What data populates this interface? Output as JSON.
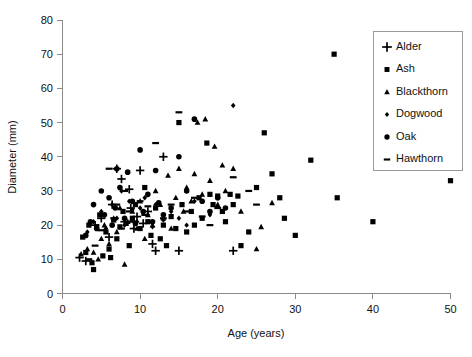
{
  "chart_data": {
    "type": "scatter",
    "title": "",
    "xlabel": "Age (years)",
    "ylabel": "Diameter (mm)",
    "xlim": [
      0,
      50
    ],
    "ylim": [
      0,
      80
    ],
    "xticks": [
      0,
      10,
      20,
      30,
      40,
      50
    ],
    "yticks": [
      0,
      10,
      20,
      30,
      40,
      50,
      60,
      70,
      80
    ],
    "grid": false,
    "legend_position": "top-right",
    "series": [
      {
        "name": "Alder",
        "marker": "plus",
        "points": [
          [
            2.2,
            10.5
          ],
          [
            3.0,
            9.5
          ],
          [
            4.2,
            20.0
          ],
          [
            5.0,
            22.0
          ],
          [
            6.0,
            16.5
          ],
          [
            6.4,
            26.0
          ],
          [
            7.0,
            36.5
          ],
          [
            7.6,
            33.5
          ],
          [
            8.0,
            21.0
          ],
          [
            8.6,
            30.5
          ],
          [
            8.8,
            25.0
          ],
          [
            9.2,
            19.0
          ],
          [
            9.6,
            22.5
          ],
          [
            10.0,
            36.0
          ],
          [
            10.4,
            20.5
          ],
          [
            11.0,
            24.0
          ],
          [
            11.6,
            14.5
          ],
          [
            12.0,
            12.5
          ],
          [
            13.0,
            40.0
          ],
          [
            15.0,
            12.5
          ],
          [
            22.0,
            12.5
          ]
        ]
      },
      {
        "name": "Ash",
        "marker": "square",
        "points": [
          [
            2.6,
            16.5
          ],
          [
            3.0,
            12.0
          ],
          [
            3.4,
            20.0
          ],
          [
            3.8,
            9.0
          ],
          [
            4.0,
            7.0
          ],
          [
            4.4,
            19.5
          ],
          [
            4.8,
            23.0
          ],
          [
            5.2,
            11.0
          ],
          [
            5.6,
            18.0
          ],
          [
            6.0,
            13.0
          ],
          [
            6.2,
            10.5
          ],
          [
            6.6,
            21.5
          ],
          [
            7.0,
            16.0
          ],
          [
            7.4,
            19.5
          ],
          [
            7.8,
            24.0
          ],
          [
            8.2,
            20.5
          ],
          [
            8.6,
            14.0
          ],
          [
            9.0,
            22.0
          ],
          [
            9.4,
            26.0
          ],
          [
            10.0,
            19.0
          ],
          [
            10.6,
            31.0
          ],
          [
            11.0,
            21.0
          ],
          [
            11.4,
            17.0
          ],
          [
            12.0,
            25.0
          ],
          [
            12.6,
            16.0
          ],
          [
            13.0,
            20.0
          ],
          [
            13.4,
            14.0
          ],
          [
            14.0,
            22.5
          ],
          [
            14.6,
            19.0
          ],
          [
            15.0,
            50.0
          ],
          [
            15.4,
            26.0
          ],
          [
            16.0,
            18.0
          ],
          [
            16.6,
            24.0
          ],
          [
            17.0,
            20.0
          ],
          [
            17.6,
            28.0
          ],
          [
            18.0,
            22.0
          ],
          [
            18.6,
            44.0
          ],
          [
            19.0,
            29.0
          ],
          [
            19.4,
            26.0
          ],
          [
            20.0,
            28.5
          ],
          [
            20.6,
            24.0
          ],
          [
            21.0,
            21.0
          ],
          [
            21.6,
            29.0
          ],
          [
            22.0,
            26.0
          ],
          [
            22.6,
            28.5
          ],
          [
            23.0,
            14.0
          ],
          [
            24.0,
            18.0
          ],
          [
            25.0,
            31.0
          ],
          [
            26.0,
            47.0
          ],
          [
            27.0,
            35.0
          ],
          [
            28.0,
            28.0
          ],
          [
            28.6,
            22.0
          ],
          [
            30.0,
            17.0
          ],
          [
            32.0,
            39.0
          ],
          [
            35.0,
            70.0
          ],
          [
            35.4,
            28.0
          ],
          [
            40.0,
            21.0
          ],
          [
            45.0,
            38.0
          ],
          [
            50.0,
            33.0
          ]
        ]
      },
      {
        "name": "Blackthorn",
        "marker": "triangle",
        "points": [
          [
            2.4,
            11.5
          ],
          [
            3.2,
            13.0
          ],
          [
            4.0,
            12.0
          ],
          [
            4.6,
            10.0
          ],
          [
            5.0,
            16.0
          ],
          [
            5.4,
            20.0
          ],
          [
            6.0,
            14.5
          ],
          [
            6.6,
            22.0
          ],
          [
            7.0,
            18.0
          ],
          [
            7.4,
            25.0
          ],
          [
            8.0,
            8.5
          ],
          [
            8.4,
            21.0
          ],
          [
            9.0,
            24.0
          ],
          [
            9.6,
            19.0
          ],
          [
            10.0,
            27.0
          ],
          [
            10.6,
            16.0
          ],
          [
            11.0,
            23.0
          ],
          [
            11.6,
            20.0
          ],
          [
            12.0,
            30.0
          ],
          [
            12.6,
            26.0
          ],
          [
            13.0,
            22.0
          ],
          [
            13.6,
            34.5
          ],
          [
            14.0,
            19.0
          ],
          [
            14.6,
            28.0
          ],
          [
            15.0,
            36.5
          ],
          [
            15.6,
            24.0
          ],
          [
            16.0,
            31.0
          ],
          [
            16.6,
            27.0
          ],
          [
            17.0,
            35.0
          ],
          [
            17.4,
            50.0
          ],
          [
            18.0,
            29.0
          ],
          [
            18.4,
            51.0
          ],
          [
            19.0,
            33.0
          ],
          [
            19.6,
            43.0
          ],
          [
            20.0,
            26.0
          ],
          [
            20.6,
            37.5
          ],
          [
            21.0,
            30.0
          ],
          [
            22.0,
            36.5
          ],
          [
            23.0,
            24.0
          ],
          [
            25.0,
            13.0
          ],
          [
            25.6,
            19.5
          ],
          [
            27.0,
            26.5
          ]
        ]
      },
      {
        "name": "Dogwood",
        "marker": "diamond",
        "points": [
          [
            3.2,
            18.0
          ],
          [
            4.0,
            21.0
          ],
          [
            5.0,
            24.0
          ],
          [
            5.6,
            19.0
          ],
          [
            6.4,
            26.0
          ],
          [
            7.0,
            22.0
          ],
          [
            7.6,
            30.0
          ],
          [
            8.0,
            20.0
          ],
          [
            8.6,
            27.0
          ],
          [
            9.0,
            24.5
          ],
          [
            9.6,
            21.0
          ],
          [
            10.0,
            25.0
          ],
          [
            10.6,
            28.0
          ],
          [
            11.0,
            23.0
          ],
          [
            11.6,
            19.5
          ],
          [
            12.0,
            26.0
          ],
          [
            13.0,
            21.5
          ],
          [
            14.0,
            24.0
          ],
          [
            15.0,
            22.0
          ],
          [
            16.0,
            20.0
          ],
          [
            17.0,
            27.0
          ],
          [
            19.0,
            23.0
          ],
          [
            22.0,
            55.0
          ]
        ]
      },
      {
        "name": "Oak",
        "marker": "circle",
        "points": [
          [
            3.0,
            17.0
          ],
          [
            3.6,
            21.0
          ],
          [
            4.0,
            26.0
          ],
          [
            4.4,
            19.0
          ],
          [
            5.0,
            30.0
          ],
          [
            5.4,
            23.0
          ],
          [
            6.0,
            28.0
          ],
          [
            6.4,
            20.0
          ],
          [
            6.8,
            25.0
          ],
          [
            7.0,
            36.5
          ],
          [
            7.4,
            31.0
          ],
          [
            8.0,
            22.0
          ],
          [
            8.4,
            35.5
          ],
          [
            9.0,
            27.0
          ],
          [
            9.4,
            20.5
          ],
          [
            10.0,
            42.0
          ],
          [
            10.4,
            24.0
          ],
          [
            11.0,
            29.0
          ],
          [
            11.6,
            21.0
          ],
          [
            12.0,
            36.0
          ],
          [
            12.4,
            26.5
          ],
          [
            13.0,
            23.0
          ],
          [
            14.0,
            25.0
          ],
          [
            15.0,
            40.0
          ],
          [
            16.0,
            30.0
          ],
          [
            17.0,
            51.0
          ],
          [
            18.0,
            27.0
          ],
          [
            19.0,
            24.0
          ],
          [
            20.0,
            28.0
          ],
          [
            21.0,
            25.0
          ]
        ]
      },
      {
        "name": "Hawthorn",
        "marker": "dash",
        "points": [
          [
            3.4,
            10.0
          ],
          [
            4.2,
            14.0
          ],
          [
            5.0,
            18.5
          ],
          [
            6.0,
            36.5
          ],
          [
            6.6,
            22.0
          ],
          [
            7.0,
            26.0
          ],
          [
            7.6,
            19.0
          ],
          [
            8.0,
            30.0
          ],
          [
            8.6,
            24.0
          ],
          [
            9.0,
            21.0
          ],
          [
            10.0,
            27.0
          ],
          [
            10.6,
            23.0
          ],
          [
            11.0,
            25.5
          ],
          [
            12.0,
            44.0
          ],
          [
            13.0,
            22.0
          ],
          [
            14.0,
            26.0
          ],
          [
            15.0,
            53.0
          ],
          [
            16.0,
            24.0
          ],
          [
            17.0,
            28.0
          ],
          [
            18.0,
            22.5
          ],
          [
            19.0,
            20.0
          ],
          [
            20.0,
            25.0
          ],
          [
            22.0,
            34.0
          ],
          [
            24.0,
            30.0
          ],
          [
            25.0,
            26.0
          ]
        ]
      }
    ]
  },
  "axes": {
    "x_title": "Age (years)",
    "y_title": "Diameter (mm)",
    "x_tick_labels": [
      "0",
      "10",
      "20",
      "30",
      "40",
      "50"
    ],
    "y_tick_labels": [
      "0",
      "10",
      "20",
      "30",
      "40",
      "50",
      "60",
      "70",
      "80"
    ]
  },
  "legend": {
    "items": [
      {
        "label": "Alder",
        "marker": "plus-icon"
      },
      {
        "label": "Ash",
        "marker": "square-icon"
      },
      {
        "label": "Blackthorn",
        "marker": "triangle-icon"
      },
      {
        "label": "Dogwood",
        "marker": "diamond-icon"
      },
      {
        "label": "Oak",
        "marker": "circle-icon"
      },
      {
        "label": "Hawthorn",
        "marker": "dash-icon"
      }
    ]
  },
  "colors": {
    "marker": "#000000",
    "axis": "#8a8a8a",
    "text": "#111111",
    "background": "#ffffff",
    "legend_border": "#9a9a9a"
  }
}
